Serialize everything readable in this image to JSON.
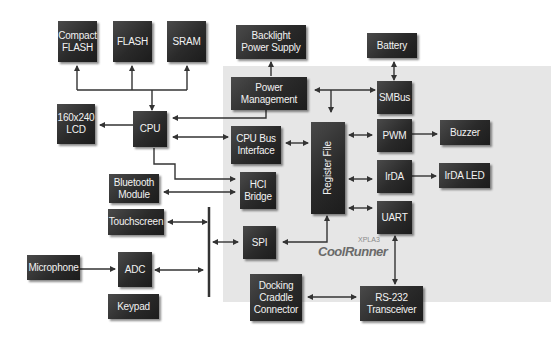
{
  "diagram": {
    "chip_label": {
      "brand": "CoolRunner",
      "family": "XPLA3"
    },
    "blocks": {
      "compact_flash": "Compact\nFLASH",
      "flash": "FLASH",
      "sram": "SRAM",
      "backlight": "Backlight\nPower Supply",
      "battery": "Battery",
      "lcd": "160x240\nLCD",
      "cpu": "CPU",
      "power_mgmt": "Power\nManagement",
      "smbus": "SMBus",
      "cpu_bus": "CPU Bus\nInterface",
      "register_file": "Register File",
      "pwm": "PWM",
      "buzzer": "Buzzer",
      "bluetooth": "Bluetooth\nModule",
      "hci": "HCI\nBridge",
      "irda": "IrDA",
      "irda_led": "IrDA LED",
      "touchscreen": "Touchscreen",
      "uart": "UART",
      "spi": "SPI",
      "microphone": "Microphone",
      "adc": "ADC",
      "keypad": "Keypad",
      "docking": "Docking\nCraddle\nConnector",
      "rs232": "RS-232\nTransceiver"
    },
    "connections": [
      {
        "from": "CPU",
        "to": "Compact FLASH",
        "type": "uni"
      },
      {
        "from": "CPU",
        "to": "FLASH",
        "type": "uni"
      },
      {
        "from": "CPU",
        "to": "SRAM",
        "type": "uni"
      },
      {
        "from": "CPU",
        "to": "160x240 LCD",
        "type": "uni"
      },
      {
        "from": "Power Management",
        "to": "Backlight Power Supply",
        "type": "uni"
      },
      {
        "from": "Power Management",
        "to": "CPU",
        "type": "uni"
      },
      {
        "from": "Battery",
        "to": "SMBus",
        "type": "bi"
      },
      {
        "from": "Power Management",
        "to": "SMBus",
        "type": "bi"
      },
      {
        "from": "CPU",
        "to": "CPU Bus Interface",
        "type": "bi"
      },
      {
        "from": "CPU Bus Interface",
        "to": "Register File",
        "type": "bi"
      },
      {
        "from": "CPU",
        "to": "HCI Bridge",
        "type": "uni"
      },
      {
        "from": "Bluetooth Module",
        "to": "HCI Bridge",
        "type": "bi"
      },
      {
        "from": "Register File",
        "to": "PWM",
        "type": "bi"
      },
      {
        "from": "PWM",
        "to": "Buzzer",
        "type": "uni"
      },
      {
        "from": "Register File",
        "to": "IrDA",
        "type": "bi"
      },
      {
        "from": "IrDA",
        "to": "IrDA LED",
        "type": "uni"
      },
      {
        "from": "Register File",
        "to": "UART",
        "type": "bi"
      },
      {
        "from": "UART",
        "to": "RS-232 Transceiver",
        "type": "bi"
      },
      {
        "from": "Docking Craddle Connector",
        "to": "RS-232 Transceiver",
        "type": "bi"
      },
      {
        "from": "Register File",
        "to": "SPI",
        "type": "uni"
      },
      {
        "from": "Touchscreen",
        "to": "SPI bus",
        "type": "bi"
      },
      {
        "from": "ADC",
        "to": "SPI bus",
        "type": "bi"
      },
      {
        "from": "SPI bus",
        "to": "SPI",
        "type": "bi"
      },
      {
        "from": "Microphone",
        "to": "ADC",
        "type": "uni"
      }
    ]
  }
}
